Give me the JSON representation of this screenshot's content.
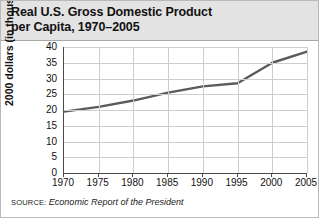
{
  "figure": {
    "title": "Real U.S. Gross Domestic Product\nper Capita, 1970–2005",
    "source_label": "SOURCE:",
    "source_text": "Economic Report of the President",
    "frame_color": "#b9b9b9",
    "header_background": "#e3e3e3",
    "grid_color": "#cdcdcd",
    "axis_color": "#4a4a4a",
    "series_color": "#5b5b5b"
  },
  "chart_data": {
    "type": "line",
    "title": "Real U.S. Gross Domestic Product per Capita, 1970–2005",
    "xlabel": "",
    "ylabel": "2000 dollars (in thousands)",
    "x": [
      1970,
      1975,
      1980,
      1985,
      1990,
      1995,
      2000,
      2005
    ],
    "values": [
      19.5,
      21.0,
      23.0,
      25.5,
      27.5,
      28.5,
      35.0,
      38.5
    ],
    "series": [
      {
        "name": "Real GDP per capita",
        "values": [
          19.5,
          21.0,
          23.0,
          25.5,
          27.5,
          28.5,
          35.0,
          38.5
        ]
      }
    ],
    "xlim": [
      1970,
      2005
    ],
    "ylim": [
      0,
      40
    ],
    "xticks": [
      1970,
      1975,
      1980,
      1985,
      1990,
      1995,
      2000,
      2005
    ],
    "yticks": [
      0,
      5,
      10,
      15,
      20,
      25,
      30,
      35,
      40
    ],
    "xticklabels": [
      "1970",
      "1975",
      "1980",
      "1985",
      "1990",
      "1995",
      "2000",
      "2005"
    ],
    "yticklabels": [
      "0",
      "5",
      "10",
      "15",
      "20",
      "25",
      "30",
      "35",
      "40"
    ],
    "grid": true,
    "legend": false,
    "units": "thousands of year-2000 dollars"
  }
}
